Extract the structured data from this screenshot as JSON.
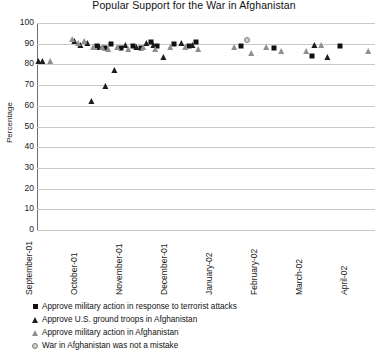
{
  "chart_data": {
    "type": "scatter",
    "title": "Popular Support for the War in Afghanistan",
    "xlabel": "",
    "ylabel": "Percentage",
    "ylim": [
      0,
      100
    ],
    "ytick_step": 10,
    "yticks": [
      100,
      90,
      80,
      70,
      60,
      50,
      40,
      30,
      20,
      10,
      0
    ],
    "categories": [
      "September-01",
      "October-01",
      "November-01",
      "December-01",
      "January-02",
      "February-02",
      "March-02",
      "April-02"
    ],
    "grid": true,
    "legend_position": "below",
    "series": [
      {
        "name": "Approve military action in response to terrorist attacks",
        "marker": "filled-square",
        "color": "#111111",
        "points": [
          {
            "x": 1.42,
            "y": 89
          },
          {
            "x": 1.58,
            "y": 88
          },
          {
            "x": 1.72,
            "y": 90
          },
          {
            "x": 1.95,
            "y": 88
          },
          {
            "x": 2.22,
            "y": 89
          },
          {
            "x": 2.38,
            "y": 88
          },
          {
            "x": 2.6,
            "y": 91
          },
          {
            "x": 2.75,
            "y": 89
          },
          {
            "x": 3.12,
            "y": 90
          },
          {
            "x": 3.45,
            "y": 89
          },
          {
            "x": 3.6,
            "y": 91
          },
          {
            "x": 4.62,
            "y": 89
          },
          {
            "x": 5.35,
            "y": 88
          },
          {
            "x": 6.18,
            "y": 84
          },
          {
            "x": 6.82,
            "y": 89
          }
        ]
      },
      {
        "name": "Approve U.S. ground troops in Afghanistan",
        "marker": "filled-triangle",
        "color": "#1c1c1c",
        "points": [
          {
            "x": 0.12,
            "y": 81
          },
          {
            "x": 0.2,
            "y": 81
          },
          {
            "x": 0.92,
            "y": 91
          },
          {
            "x": 1.05,
            "y": 89
          },
          {
            "x": 1.2,
            "y": 90
          },
          {
            "x": 1.3,
            "y": 62
          },
          {
            "x": 1.48,
            "y": 88
          },
          {
            "x": 1.62,
            "y": 69
          },
          {
            "x": 1.8,
            "y": 77
          },
          {
            "x": 2.05,
            "y": 89
          },
          {
            "x": 2.3,
            "y": 88
          },
          {
            "x": 2.52,
            "y": 90
          },
          {
            "x": 2.68,
            "y": 89
          },
          {
            "x": 2.9,
            "y": 83
          },
          {
            "x": 3.3,
            "y": 90
          },
          {
            "x": 3.55,
            "y": 89
          },
          {
            "x": 6.25,
            "y": 89
          },
          {
            "x": 6.55,
            "y": 83
          }
        ]
      },
      {
        "name": "Approve military action in Afghanistan",
        "marker": "open-triangle",
        "color": "#8f8f8f",
        "points": [
          {
            "x": 0.38,
            "y": 81
          },
          {
            "x": 0.88,
            "y": 92
          },
          {
            "x": 1.0,
            "y": 90
          },
          {
            "x": 1.15,
            "y": 91
          },
          {
            "x": 1.35,
            "y": 88
          },
          {
            "x": 1.55,
            "y": 88
          },
          {
            "x": 1.68,
            "y": 87
          },
          {
            "x": 1.88,
            "y": 88
          },
          {
            "x": 2.12,
            "y": 87
          },
          {
            "x": 2.45,
            "y": 88
          },
          {
            "x": 2.72,
            "y": 87
          },
          {
            "x": 3.05,
            "y": 88
          },
          {
            "x": 3.38,
            "y": 88
          },
          {
            "x": 3.68,
            "y": 87
          },
          {
            "x": 4.48,
            "y": 88
          },
          {
            "x": 4.85,
            "y": 85
          },
          {
            "x": 5.18,
            "y": 88
          },
          {
            "x": 5.52,
            "y": 86
          },
          {
            "x": 6.08,
            "y": 86
          },
          {
            "x": 6.42,
            "y": 89
          },
          {
            "x": 7.45,
            "y": 86
          }
        ]
      },
      {
        "name": "War in Afghanistan was not a mistake",
        "marker": "open-circle",
        "color": "#7d7d7d",
        "points": [
          {
            "x": 4.75,
            "y": 92
          }
        ]
      }
    ]
  }
}
